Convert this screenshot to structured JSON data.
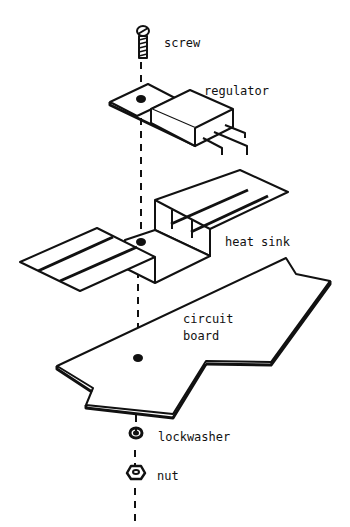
{
  "diagram": {
    "type": "exploded assembly view",
    "labels": {
      "screw": "screw",
      "regulator": "regulator",
      "heat_sink": "heat sink",
      "circuit_board_line1": "circuit",
      "circuit_board_line2": "board",
      "lockwasher": "lockwasher",
      "nut": "nut"
    },
    "parts_order_top_to_bottom": [
      "screw",
      "regulator",
      "heat sink",
      "circuit board",
      "lockwasher",
      "nut"
    ],
    "colors": {
      "ink": "#111111",
      "background": "#ffffff"
    }
  }
}
